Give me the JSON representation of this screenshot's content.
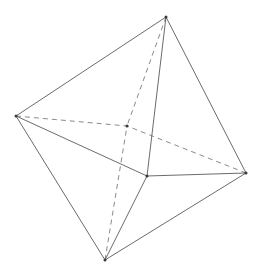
{
  "figure": {
    "shape_name": "octahedron",
    "background_color": "#ffffff",
    "solid_edge_color": "#5a5a5a",
    "hidden_edge_color": "#7d7d7d",
    "vertex_color": "#3a3a3a",
    "stroke_width": 0.9,
    "hidden_dash_pattern": "5 4",
    "canvas": {
      "width": 260,
      "height": 276
    },
    "vertices": [
      {
        "id": "top",
        "label": "top apex",
        "x": 166,
        "y": 17
      },
      {
        "id": "left",
        "label": "left vertex",
        "x": 16,
        "y": 116
      },
      {
        "id": "right",
        "label": "right vertex",
        "x": 246,
        "y": 173
      },
      {
        "id": "bottom",
        "label": "bottom apex",
        "x": 105,
        "y": 260
      },
      {
        "id": "front",
        "label": "front center vertex",
        "x": 147,
        "y": 176
      },
      {
        "id": "back",
        "label": "back hidden vertex",
        "x": 127,
        "y": 126
      }
    ],
    "edges_solid": [
      {
        "id": "top-left",
        "from": [
          166,
          17
        ],
        "to": [
          16,
          116
        ]
      },
      {
        "id": "top-right",
        "from": [
          166,
          17
        ],
        "to": [
          246,
          173
        ]
      },
      {
        "id": "top-front",
        "from": [
          166,
          17
        ],
        "to": [
          147,
          176
        ]
      },
      {
        "id": "left-bottom",
        "from": [
          16,
          116
        ],
        "to": [
          105,
          260
        ]
      },
      {
        "id": "left-front",
        "from": [
          16,
          116
        ],
        "to": [
          147,
          176
        ]
      },
      {
        "id": "bottom-front",
        "from": [
          105,
          260
        ],
        "to": [
          147,
          176
        ]
      },
      {
        "id": "bottom-right",
        "from": [
          105,
          260
        ],
        "to": [
          246,
          173
        ]
      },
      {
        "id": "front-right",
        "from": [
          147,
          176
        ],
        "to": [
          246,
          173
        ]
      }
    ],
    "edges_hidden": [
      {
        "id": "top-back",
        "from": [
          166,
          17
        ],
        "to": [
          127,
          126
        ]
      },
      {
        "id": "left-back",
        "from": [
          16,
          116
        ],
        "to": [
          127,
          126
        ]
      },
      {
        "id": "right-back",
        "from": [
          246,
          173
        ],
        "to": [
          127,
          126
        ]
      },
      {
        "id": "bottom-back",
        "from": [
          105,
          260
        ],
        "to": [
          127,
          126
        ]
      }
    ]
  }
}
